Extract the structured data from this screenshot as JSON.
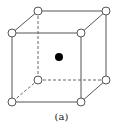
{
  "diagram": {
    "type": "body-centered cubic unit cell",
    "caption": "(a)",
    "colors": {
      "line": "#555555",
      "open_atom_fill": "#ffffff",
      "center_atom": "#000000"
    },
    "corner_atoms": 8,
    "center_atoms": 1
  }
}
